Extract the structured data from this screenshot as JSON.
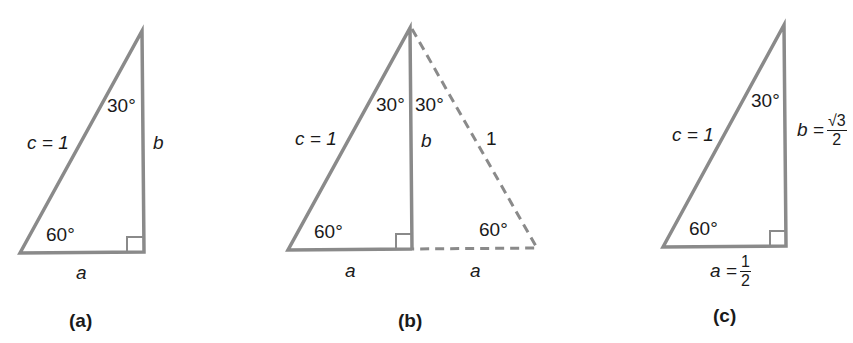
{
  "colors": {
    "stroke": "#8a8a8a",
    "text": "#1a1a1a",
    "background": "#ffffff"
  },
  "panels": [
    {
      "caption": "(a)",
      "labels": {
        "hyp": "c = 1",
        "top_angle": "30°",
        "bottom_angle": "60°",
        "vertical": "b",
        "base": "a"
      }
    },
    {
      "caption": "(b)",
      "labels": {
        "hyp": "c = 1",
        "top_angle_left": "30°",
        "top_angle_right": "30°",
        "bottom_angle_left": "60°",
        "bottom_angle_right": "60°",
        "vertical": "b",
        "dashed_side": "1",
        "base_left": "a",
        "base_right": "a"
      }
    },
    {
      "caption": "(c)",
      "labels": {
        "hyp": "c = 1",
        "top_angle": "30°",
        "bottom_angle": "60°",
        "vertical_prefix": "b =",
        "vertical_num": "√3",
        "vertical_den": "2",
        "base_prefix": "a =",
        "base_num": "1",
        "base_den": "2"
      }
    }
  ]
}
